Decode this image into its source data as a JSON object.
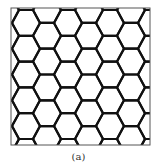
{
  "figure": {
    "caption": "(a)",
    "lattice": {
      "type": "hexagonal-flat-top",
      "edge_length": 14,
      "half_height": 12.9,
      "first_center_x": 26,
      "first_center_y": 22.9,
      "columns": 9,
      "rows": 7,
      "stroke_color": "#111111",
      "stroke_width": 2.2
    },
    "frame": {
      "x": 11,
      "y": 8,
      "width": 139,
      "height": 137,
      "stroke_color": "#555555"
    }
  }
}
